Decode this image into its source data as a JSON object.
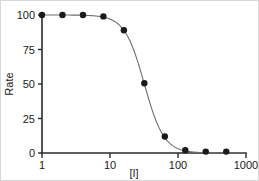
{
  "chart_data": {
    "type": "line",
    "title": "",
    "subtitle": "",
    "xlabel": "[I]",
    "ylabel": "Rate",
    "xscale": "log",
    "yscale": "linear",
    "xlim": [
      1,
      1000
    ],
    "ylim": [
      0,
      100
    ],
    "grid": false,
    "legend": null,
    "legend_position": "none",
    "xticks": [
      1,
      10,
      100,
      1000
    ],
    "xtick_labels": [
      "1",
      "10",
      "100",
      "1000"
    ],
    "yticks": [
      0,
      25,
      50,
      75,
      100
    ],
    "ytick_labels": [
      "0",
      "25",
      "50",
      "75",
      "100"
    ],
    "marker_style": "filled-circle",
    "marker_color": "#1a1a1a",
    "line_color": "#6e6e6e",
    "axis_color": "#2a2a2a",
    "background_color": "#ffffff",
    "series": [
      {
        "name": "Rate vs [I]",
        "x": [
          1,
          2,
          4,
          8,
          16,
          32,
          64,
          128,
          256,
          512
        ],
        "values": [
          100,
          100,
          100,
          99,
          89,
          50.5,
          12,
          2,
          1,
          1
        ]
      }
    ],
    "fit": {
      "model": "four-parameter-logistic",
      "top": 100,
      "bottom": 0,
      "ic50": 32,
      "hill_slope": 3.0
    },
    "annotations": []
  },
  "figure": {
    "border_color": "#d8d8d8",
    "width": 259,
    "height": 181
  }
}
